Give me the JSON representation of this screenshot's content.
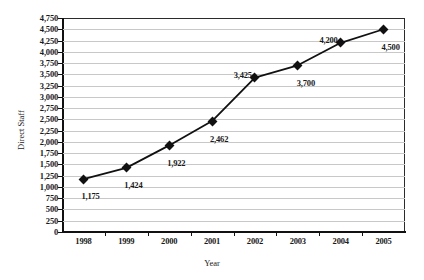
{
  "chart_data": {
    "type": "line",
    "title": "",
    "xlabel": "Year",
    "ylabel": "Direct Staff",
    "categories": [
      "1998",
      "1999",
      "2000",
      "2001",
      "2002",
      "2003",
      "2004",
      "2005"
    ],
    "values": [
      1175,
      1424,
      1922,
      2462,
      3425,
      3700,
      4200,
      4500
    ],
    "point_labels": [
      "1,175",
      "1,424",
      "1,922",
      "2,462",
      "3,425",
      "3,700",
      "4,200",
      "4,500"
    ],
    "ylim": [
      0,
      4750
    ],
    "ytick_step": 250,
    "ytick_labels": [
      "4,750",
      "4,500",
      "4,250",
      "4,000",
      "3,750",
      "3,500",
      "3,250",
      "3,000",
      "2,750",
      "2,500",
      "2,250",
      "2,000",
      "1,750",
      "1,500",
      "1,250",
      "1,000",
      "750",
      "500",
      "250",
      "0"
    ],
    "grid": true,
    "legend": "none",
    "series": [
      {
        "name": "Direct Staff",
        "values": [
          1175,
          1424,
          1922,
          2462,
          3425,
          3700,
          4200,
          4500
        ],
        "marker": "diamond",
        "color": "#111111"
      }
    ],
    "colors": {
      "line": "#111111",
      "marker": "#111111",
      "gridline": "#c8c8c8",
      "axis": "#111111",
      "text": "#1a1a1a",
      "background": "#ffffff"
    }
  }
}
